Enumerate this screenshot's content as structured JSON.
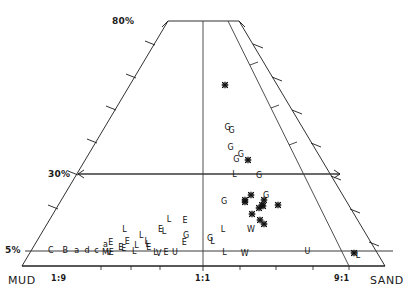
{
  "chart_data": {
    "type": "scatter",
    "title": "",
    "xlabel": "",
    "ylabel": "",
    "diagram": "sand-mud ratio vs. gravel percent trapezoid (Folk-type) sediment classification",
    "axes": {
      "bottom_left_label": "MUD",
      "bottom_right_label": "SAND",
      "bottom_ticks": [
        "1:9",
        "1:1",
        "9:1"
      ],
      "left_percent_ticks": [
        "80%",
        "30%",
        "5%"
      ],
      "gridlines": [
        "5%",
        "30%",
        "80%"
      ],
      "x_axis_meaning": "sand:mud ratio",
      "y_axis_meaning": "percent gravel",
      "ylim": [
        0,
        80
      ],
      "grid": true,
      "legend_position": "none"
    },
    "series": [
      {
        "name": "lettered-samples",
        "marker": "letter-glyph",
        "points": [
          {
            "label": "*",
            "x": 0.645,
            "y": 0.74
          },
          {
            "label": "G",
            "x": 0.622,
            "y": 0.565
          },
          {
            "label": "G",
            "x": 0.639,
            "y": 0.552
          },
          {
            "label": "G",
            "x": 0.622,
            "y": 0.483
          },
          {
            "label": "G",
            "x": 0.662,
            "y": 0.455
          },
          {
            "label": "G",
            "x": 0.639,
            "y": 0.432
          },
          {
            "label": "*",
            "x": 0.687,
            "y": 0.432
          },
          {
            "label": "L",
            "x": 0.622,
            "y": 0.372
          },
          {
            "label": "G",
            "x": 0.718,
            "y": 0.368
          },
          {
            "label": "G",
            "x": 0.572,
            "y": 0.262
          },
          {
            "label": "*",
            "x": 0.672,
            "y": 0.29
          },
          {
            "label": "*",
            "x": 0.645,
            "y": 0.268
          },
          {
            "label": "*",
            "x": 0.645,
            "y": 0.26
          },
          {
            "label": "G",
            "x": 0.724,
            "y": 0.285
          },
          {
            "label": "*",
            "x": 0.712,
            "y": 0.268
          },
          {
            "label": "*",
            "x": 0.7,
            "y": 0.247
          },
          {
            "label": "*",
            "x": 0.757,
            "y": 0.251
          },
          {
            "label": "*",
            "x": 0.703,
            "y": 0.243
          },
          {
            "label": "*",
            "x": 0.69,
            "y": 0.238
          },
          {
            "label": "*",
            "x": 0.66,
            "y": 0.212
          },
          {
            "label": "*",
            "x": 0.682,
            "y": 0.186
          },
          {
            "label": "*",
            "x": 0.695,
            "y": 0.172
          },
          {
            "label": "L",
            "x": 0.388,
            "y": 0.188
          },
          {
            "label": "E",
            "x": 0.44,
            "y": 0.183
          },
          {
            "label": "L",
            "x": 0.253,
            "y": 0.148
          },
          {
            "label": "E",
            "x": 0.366,
            "y": 0.145
          },
          {
            "label": "L",
            "x": 0.378,
            "y": 0.137
          },
          {
            "label": "L",
            "x": 0.561,
            "y": 0.145
          },
          {
            "label": "W",
            "x": 0.648,
            "y": 0.145
          },
          {
            "label": "L",
            "x": 0.31,
            "y": 0.121
          },
          {
            "label": "G",
            "x": 0.447,
            "y": 0.122
          },
          {
            "label": "G",
            "x": 0.52,
            "y": 0.111
          },
          {
            "label": "E",
            "x": 0.443,
            "y": 0.092
          },
          {
            "label": "L",
            "x": 0.527,
            "y": 0.1
          },
          {
            "label": "L",
            "x": 0.33,
            "y": 0.1
          },
          {
            "label": "E",
            "x": 0.272,
            "y": 0.097
          },
          {
            "label": "E",
            "x": 0.224,
            "y": 0.092
          },
          {
            "label": "a",
            "x": 0.21,
            "y": 0.086
          },
          {
            "label": "L",
            "x": 0.335,
            "y": 0.085
          },
          {
            "label": "L",
            "x": 0.303,
            "y": 0.08
          },
          {
            "label": "E",
            "x": 0.258,
            "y": 0.074
          },
          {
            "label": "E",
            "x": 0.34,
            "y": 0.072
          },
          {
            "label": "E",
            "x": 0.268,
            "y": 0.068
          },
          {
            "label": "C",
            "x": 0.058,
            "y": 0.06
          },
          {
            "label": "B",
            "x": 0.1,
            "y": 0.06
          },
          {
            "label": "a",
            "x": 0.133,
            "y": 0.06
          },
          {
            "label": "d",
            "x": 0.163,
            "y": 0.06
          },
          {
            "label": "c",
            "x": 0.19,
            "y": 0.06
          },
          {
            "label": "L",
            "x": 0.3,
            "y": 0.058
          },
          {
            "label": "v",
            "x": 0.228,
            "y": 0.055
          },
          {
            "label": "E",
            "x": 0.234,
            "y": 0.055
          },
          {
            "label": "M",
            "x": 0.218,
            "y": 0.052
          },
          {
            "label": "L",
            "x": 0.362,
            "y": 0.052
          },
          {
            "label": "V",
            "x": 0.372,
            "y": 0.049
          },
          {
            "label": "E",
            "x": 0.392,
            "y": 0.052
          },
          {
            "label": "U",
            "x": 0.418,
            "y": 0.052
          },
          {
            "label": "L",
            "x": 0.56,
            "y": 0.052
          },
          {
            "label": "W",
            "x": 0.618,
            "y": 0.05
          },
          {
            "label": "U",
            "x": 0.8,
            "y": 0.058
          },
          {
            "label": "*",
            "x": 0.935,
            "y": 0.055
          },
          {
            "label": "L",
            "x": 0.94,
            "y": 0.04
          }
        ]
      }
    ]
  },
  "labels": {
    "mud": "MUD",
    "sand": "SAND",
    "ratio_1_9": "1:9",
    "ratio_1_1": "1:1",
    "ratio_9_1": "9:1",
    "pct_80": "80%",
    "pct_30": "30%",
    "pct_5": "5%"
  }
}
